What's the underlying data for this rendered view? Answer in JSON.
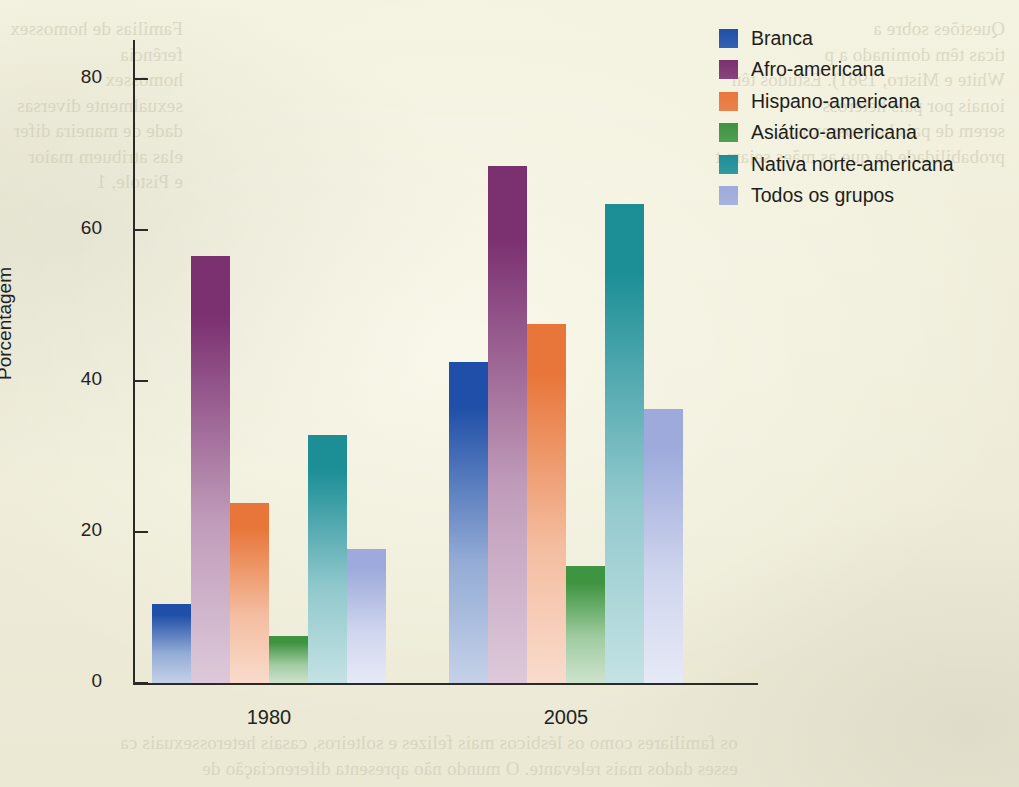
{
  "chart_data": {
    "type": "bar",
    "title": "",
    "xlabel": "",
    "ylabel": "Porcentagem",
    "categories": [
      "1980",
      "2005"
    ],
    "ylim": [
      0,
      88
    ],
    "yticks": [
      0,
      20,
      40,
      60,
      80
    ],
    "ytick_labels": [
      "0",
      "20",
      "40",
      "60",
      "80"
    ],
    "grid": false,
    "legend_position": "top-right",
    "series": [
      {
        "name": "Branca",
        "color": "#1f4fa8",
        "values": [
          10.5,
          42.5
        ]
      },
      {
        "name": "Afro-americana",
        "color": "#7b3070",
        "values": [
          56.5,
          68.5
        ]
      },
      {
        "name": "Hispano-americana",
        "color": "#e8763a",
        "values": [
          23.8,
          47.5
        ]
      },
      {
        "name": "Asiático-americana",
        "color": "#3e9440",
        "values": [
          6.2,
          15.5
        ]
      },
      {
        "name": "Nativa norte-americana",
        "color": "#1c8e96",
        "values": [
          32.8,
          63.5
        ]
      },
      {
        "name": "Todos os grupos",
        "color": "#9daadb",
        "values": [
          17.8,
          36.3
        ]
      }
    ]
  },
  "legend": {
    "items": [
      {
        "label": "Branca"
      },
      {
        "label": "Afro-americana"
      },
      {
        "label": "Hispano-americana"
      },
      {
        "label": "Asiático-americana"
      },
      {
        "label": "Nativa norte-americana"
      },
      {
        "label": "Todos os grupos"
      }
    ]
  },
  "axes": {
    "y_title": "Porcentagem",
    "y_ticks": [
      "80",
      "60",
      "40",
      "20",
      "0"
    ],
    "x_ticks": [
      "1980",
      "2005"
    ]
  },
  "background_text": {
    "right_block": "Questões sobre a  \nticas têm dominado a p\nWhite e Mistro, 1981). Estudos tên\nionais por pais heteross\nserem de pais heterossexuais,\nprobabilidade de que as mães sejam t",
    "left_block": "Famílias de homossex\nferência  \nhomossex\nsexualmente diversas\ndade de maneira difer\nelas atribuem maior\ne Pistole, 1",
    "bottom_block": "os familiares como os lésbicos mais felizes e solteiros, casais heterossexuais ca\nesses dados mais relevante. O mundo não apresenta diferenciação de"
  },
  "colors": {
    "paper": "#f2f0dd",
    "axis": "#2a2a26",
    "text": "#23231f"
  }
}
